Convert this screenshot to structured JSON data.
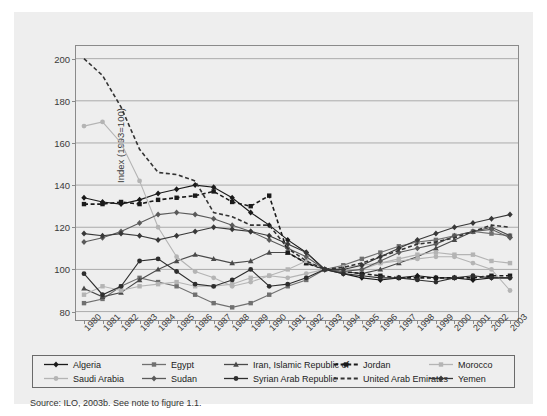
{
  "figure": {
    "background": "#eeeeee",
    "source_note": "Source: ILO, 2003b. See note to figure 1.1.",
    "header_faint": ""
  },
  "axes": {
    "y_title": "Index (1993=100)",
    "y_ticks": [
      80,
      100,
      120,
      140,
      160,
      180,
      200
    ],
    "x_ticks": [
      "1980",
      "1981",
      "1982",
      "1983",
      "1984",
      "1985",
      "1986",
      "1987",
      "1988",
      "1989",
      "1990",
      "1991",
      "1992",
      "1993",
      "1994",
      "1995",
      "1996",
      "1997",
      "1998",
      "1999",
      "2000",
      "2001",
      "2002",
      "2003"
    ]
  },
  "legend": {
    "entries": [
      {
        "label": "Algeria",
        "color": "#1a1a1a",
        "marker": "diamond",
        "dashed": false
      },
      {
        "label": "Egypt",
        "color": "#707070",
        "marker": "square",
        "dashed": false
      },
      {
        "label": "Iran, Islamic Republic of",
        "color": "#4a4a4a",
        "marker": "triangle",
        "dashed": false
      },
      {
        "label": "Jordan",
        "color": "#1a1a1a",
        "marker": "square",
        "dashed": true
      },
      {
        "label": "Morocco",
        "color": "#b4b4b4",
        "marker": "square",
        "dashed": false
      },
      {
        "label": "Saudi Arabia",
        "color": "#b4b4b4",
        "marker": "circle",
        "dashed": false
      },
      {
        "label": "Sudan",
        "color": "#5a5a5a",
        "marker": "diamond",
        "dashed": false
      },
      {
        "label": "Syrian Arab Republic",
        "color": "#2e2e2e",
        "marker": "circle",
        "dashed": false
      },
      {
        "label": "United Arab Emirates",
        "color": "#333333",
        "marker": "none",
        "dashed": true
      },
      {
        "label": "Yemen",
        "color": "#383838",
        "marker": "diamond",
        "dashed": false
      }
    ]
  },
  "chart_data": {
    "type": "line",
    "title": "",
    "subtitle": "",
    "xlabel": "",
    "ylabel": "Index (1993=100)",
    "xlim": [
      "1980",
      "2003"
    ],
    "ylim": [
      76,
      206
    ],
    "grid": "horizontal",
    "legend_position": "bottom",
    "x": [
      "1980",
      "1981",
      "1982",
      "1983",
      "1984",
      "1985",
      "1986",
      "1987",
      "1988",
      "1989",
      "1990",
      "1991",
      "1992",
      "1993",
      "1994",
      "1995",
      "1996",
      "1997",
      "1998",
      "1999",
      "2000",
      "2001",
      "2002",
      "2003"
    ],
    "series": [
      {
        "name": "Algeria",
        "color": "#1a1a1a",
        "marker": "diamond",
        "dashed": false,
        "values": [
          134,
          132,
          131,
          133,
          136,
          138,
          140,
          139,
          134,
          127,
          121,
          114,
          108,
          100,
          98,
          96,
          95,
          96,
          97,
          96,
          96,
          95,
          96,
          96
        ]
      },
      {
        "name": "Egypt",
        "color": "#707070",
        "marker": "square",
        "dashed": false,
        "values": [
          84,
          86,
          92,
          96,
          94,
          92,
          88,
          84,
          82,
          84,
          88,
          92,
          95,
          100,
          102,
          105,
          108,
          111,
          113,
          114,
          116,
          118,
          117,
          116
        ]
      },
      {
        "name": "Iran, Islamic Republic of",
        "color": "#4a4a4a",
        "marker": "triangle",
        "dashed": false,
        "values": [
          91,
          87,
          89,
          95,
          100,
          104,
          107,
          105,
          103,
          104,
          108,
          108,
          103,
          100,
          99,
          98,
          100,
          103,
          106,
          110,
          114,
          118,
          120,
          116
        ]
      },
      {
        "name": "Jordan",
        "color": "#1a1a1a",
        "marker": "square",
        "dashed": true,
        "values": [
          131,
          131,
          132,
          131,
          133,
          134,
          135,
          137,
          132,
          130,
          135,
          108,
          103,
          100,
          99,
          98,
          97,
          96,
          96,
          96,
          96,
          96,
          97,
          97
        ]
      },
      {
        "name": "Morocco",
        "color": "#b4b4b4",
        "marker": "square",
        "dashed": false,
        "values": [
          88,
          92,
          90,
          92,
          93,
          94,
          92,
          92,
          93,
          96,
          97,
          100,
          104,
          100,
          99,
          100,
          103,
          105,
          107,
          108,
          107,
          107,
          104,
          103
        ]
      },
      {
        "name": "Saudi Arabia",
        "color": "#b4b4b4",
        "marker": "circle",
        "dashed": false,
        "values": [
          168,
          170,
          160,
          142,
          120,
          106,
          99,
          96,
          92,
          94,
          97,
          96,
          98,
          100,
          101,
          102,
          103,
          104,
          105,
          106,
          106,
          103,
          100,
          90
        ]
      },
      {
        "name": "Sudan",
        "color": "#5a5a5a",
        "marker": "diamond",
        "dashed": false,
        "values": [
          113,
          115,
          118,
          122,
          126,
          127,
          126,
          124,
          121,
          118,
          114,
          110,
          106,
          100,
          99,
          100,
          104,
          108,
          110,
          112,
          116,
          118,
          119,
          115
        ]
      },
      {
        "name": "Syrian Arab Republic",
        "color": "#2e2e2e",
        "marker": "circle",
        "dashed": false,
        "values": [
          98,
          88,
          92,
          104,
          105,
          99,
          93,
          92,
          95,
          100,
          92,
          93,
          96,
          100,
          98,
          97,
          96,
          96,
          95,
          94,
          96,
          97,
          96,
          96
        ]
      },
      {
        "name": "United Arab Emirates",
        "color": "#333333",
        "marker": "none",
        "dashed": true,
        "values": [
          200,
          192,
          177,
          157,
          146,
          145,
          142,
          127,
          125,
          121,
          121,
          110,
          104,
          100,
          101,
          103,
          106,
          109,
          112,
          113,
          115,
          118,
          121,
          120
        ]
      },
      {
        "name": "Yemen",
        "color": "#383838",
        "marker": "diamond",
        "dashed": false,
        "values": [
          117,
          116,
          117,
          116,
          114,
          116,
          118,
          120,
          119,
          118,
          116,
          112,
          108,
          100,
          100,
          102,
          106,
          110,
          114,
          117,
          120,
          122,
          124,
          126
        ]
      }
    ]
  }
}
